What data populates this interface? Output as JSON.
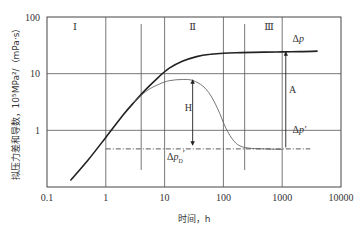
{
  "chart_data": {
    "type": "line",
    "title": "",
    "xlabel": "时间，h",
    "ylabel": "拟压力差和导数，10⁵MPa²/（mPa·s）",
    "xscale": "log",
    "yscale": "log",
    "xlim": [
      0.1,
      10000
    ],
    "ylim": [
      0.1,
      100
    ],
    "xticks": [
      0.1,
      1,
      10,
      100,
      1000,
      10000
    ],
    "xtick_labels": [
      "0.1",
      "1",
      "10",
      "100",
      "1000",
      "10000"
    ],
    "yticks": [
      1,
      10,
      100
    ],
    "ytick_labels": [
      "1",
      "10",
      "100"
    ],
    "grid": true,
    "regions": [
      {
        "label": "Ⅰ",
        "x_from": 0.1,
        "x_to": 4
      },
      {
        "label": "Ⅱ",
        "x_from": 4,
        "x_to": 230
      },
      {
        "label": "Ⅲ",
        "x_from": 230,
        "x_to": 10000
      }
    ],
    "region_boundaries": [
      4,
      230
    ],
    "series": [
      {
        "name": "Δp",
        "style": "solid-thick",
        "x": [
          0.25,
          0.5,
          1,
          2,
          3,
          5,
          8,
          12,
          20,
          35,
          60,
          100,
          200,
          500,
          1000,
          2000,
          4000
        ],
        "y": [
          0.13,
          0.3,
          0.75,
          1.9,
          3.1,
          5.5,
          8.8,
          12.5,
          16.5,
          20,
          22,
          23,
          23.5,
          24,
          24.2,
          24.5,
          25
        ]
      },
      {
        "name": "Δp'",
        "style": "solid-thin",
        "x": [
          3,
          5,
          8,
          12,
          20,
          30,
          45,
          60,
          80,
          110,
          150,
          200,
          300,
          500,
          1000
        ],
        "y": [
          3.1,
          5,
          6.5,
          7.5,
          7.9,
          7.6,
          6,
          4.2,
          2.4,
          1.1,
          0.65,
          0.52,
          0.48,
          0.47,
          0.46
        ]
      },
      {
        "name": "Δp_D'",
        "style": "dash-dot",
        "x": [
          1,
          3000
        ],
        "y": [
          0.47,
          0.47
        ]
      }
    ],
    "annotations": [
      {
        "text": "Δp",
        "x": 1500,
        "y": 36
      },
      {
        "text": "A",
        "x": 1300,
        "y": 4.5,
        "arrow": {
          "x": 1150,
          "from": 0.5,
          "to": 24
        }
      },
      {
        "text": "Δp′",
        "x": 1500,
        "y": 0.9
      },
      {
        "text": "H",
        "x": 22,
        "y": 2.2,
        "arrow": {
          "x": 30,
          "from": 0.55,
          "to": 7.7
        }
      },
      {
        "text": "Δp_D′",
        "x": 11,
        "y": 0.3
      }
    ]
  }
}
